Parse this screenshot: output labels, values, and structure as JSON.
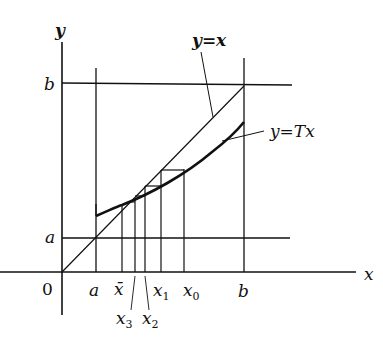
{
  "diagram": {
    "type": "fixed-point-iteration",
    "axes": {
      "x_label": "x",
      "y_label": "y",
      "origin_label": "0"
    },
    "y_ticks": [
      {
        "label": "b",
        "value": "b"
      },
      {
        "label": "a",
        "value": "a"
      }
    ],
    "x_ticks": [
      {
        "label": "a",
        "id": "a"
      },
      {
        "label": "x̄",
        "id": "xbar"
      },
      {
        "label": "x",
        "sub": "3",
        "id": "x3"
      },
      {
        "label": "x",
        "sub": "2",
        "id": "x2"
      },
      {
        "label": "x",
        "sub": "1",
        "id": "x1"
      },
      {
        "label": "x",
        "sub": "0",
        "id": "x0"
      },
      {
        "label": "b",
        "id": "b"
      }
    ],
    "curves": {
      "identity": {
        "label": "y=x"
      },
      "map": {
        "label": "y=Tx"
      }
    },
    "colors": {
      "ink": "#111111",
      "background": "#ffffff"
    }
  }
}
